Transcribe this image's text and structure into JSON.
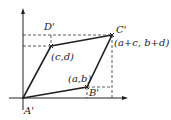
{
  "diagram": {
    "type": "parallelogram-vectors",
    "labels": {
      "A": "A'",
      "B": "B'",
      "C": "C'",
      "D": "D'",
      "point_ab": "(a,b)",
      "point_cd": "(c,d)",
      "point_sum": "(a+c, b+d)"
    },
    "colors": {
      "line": "#222222",
      "dashed": "#333333",
      "background": "#ffffff"
    }
  }
}
